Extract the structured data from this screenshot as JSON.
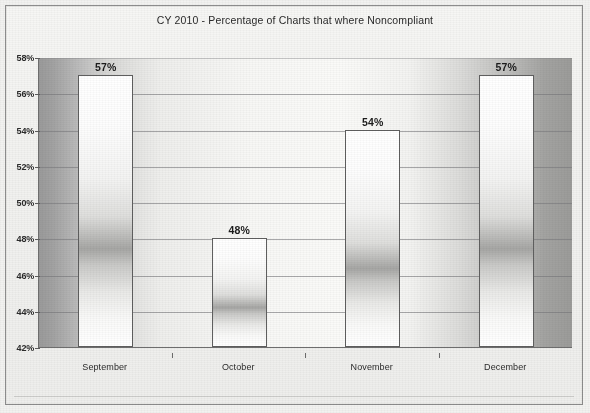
{
  "chart_data": {
    "type": "bar",
    "title": "CY 2010 - Percentage of Charts that where Noncompliant",
    "xlabel": "",
    "ylabel": "",
    "categories": [
      "September",
      "October",
      "November",
      "December"
    ],
    "values": [
      57,
      48,
      54,
      57
    ],
    "value_labels": [
      "57%",
      "48%",
      "54%",
      "57%"
    ],
    "ylim": [
      42,
      58
    ],
    "yticks": [
      42,
      44,
      46,
      48,
      50,
      52,
      54,
      56,
      58
    ],
    "ytick_labels": [
      "42%",
      "44%",
      "46%",
      "48%",
      "50%",
      "52%",
      "54%",
      "56%",
      "58%"
    ],
    "grid": "horizontal",
    "legend": "none",
    "series": [
      {
        "name": "Percentage Noncompliant",
        "values": [
          57,
          48,
          54,
          57
        ]
      }
    ],
    "colors": {
      "bar_fill_light": "#ffffff",
      "bar_fill_shadow": "#a6a6a4",
      "bar_border": "#5f5f5f",
      "plot_background_edge": "#9a9a9a",
      "plot_background_center": "#fafaf8",
      "gridline": "#78787a",
      "text": "#2b2b2b",
      "frame_border": "#8d8d8d"
    }
  }
}
